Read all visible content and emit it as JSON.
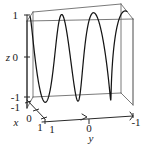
{
  "figure": {
    "background_color": "#ffffff",
    "curve_color": "#151515",
    "box_color": "#6b6b6b",
    "axis_color": "#2b2b2b"
  },
  "axes": {
    "x": {
      "title": "x",
      "ticks": [
        "-1",
        "0",
        "1"
      ],
      "range": [
        -1,
        1
      ],
      "title_pos": {
        "x": 14,
        "y": 125
      }
    },
    "y": {
      "title": "y",
      "ticks": [
        "1",
        "0",
        "-1"
      ],
      "range": [
        1,
        -1
      ],
      "title_pos": {
        "x": 89,
        "y": 141
      }
    },
    "z": {
      "title": "z",
      "ticks": [
        "1",
        "0",
        "-1"
      ],
      "range": [
        -1,
        1
      ],
      "title_pos": {
        "x": 8,
        "y": 61
      }
    }
  },
  "labels": {
    "z_top": "1",
    "z_mid": "0",
    "z_bot": "-1",
    "x_neg1": "-1",
    "x_zero": "0",
    "x_one": "1",
    "y_one": "1",
    "y_zero": "0",
    "y_neg1": "-1",
    "x_title": "x",
    "y_title": "y",
    "z_title": "z"
  },
  "chart_data": {
    "type": "line",
    "title": "",
    "xlabel": "x",
    "ylabel": "y",
    "zlabel": "z",
    "projection": "3d",
    "grid": false,
    "legend": null,
    "xlim": [
      -1,
      1
    ],
    "ylim": [
      1,
      -1
    ],
    "zlim": [
      -1,
      1
    ],
    "xticks": [
      -1,
      0,
      1
    ],
    "yticks": [
      1,
      0,
      -1
    ],
    "zticks": [
      -1,
      0,
      1
    ],
    "series": [
      {
        "name": "space curve",
        "parametric": true,
        "t_range": [
          0,
          6.283185307179586
        ],
        "x_expr": "sin(3t)",
        "y_expr": "t mapped to [1,-1]",
        "z_expr": "cos(3t)",
        "n_points": 400,
        "description": "3D parametric space curve oscillating about 3 full periods across the y-extent, spanning z from -1 to 1 and x from -1 to 1"
      }
    ]
  }
}
